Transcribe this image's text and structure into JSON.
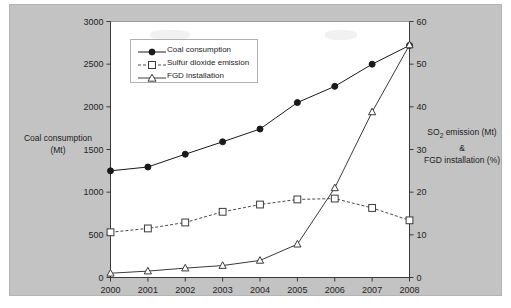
{
  "chart_data": {
    "type": "line",
    "title": "",
    "xlabel": "",
    "ylabel": "Coal consumption (Mt)",
    "y2label": "SO2 emission (Mt) & FGD installation (%)",
    "categories": [
      "2000",
      "2001",
      "2002",
      "2003",
      "2004",
      "2005",
      "2006",
      "2007",
      "2008"
    ],
    "x": [
      2000,
      2001,
      2002,
      2003,
      2004,
      2005,
      2006,
      2007,
      2008
    ],
    "ylim": [
      0,
      3000
    ],
    "y2lim": [
      0,
      60
    ],
    "yticks": [
      0,
      500,
      1000,
      1500,
      2000,
      2500,
      3000
    ],
    "y2ticks": [
      0,
      10,
      20,
      30,
      40,
      50,
      60
    ],
    "grid": false,
    "legend_position": "upper-left-inside",
    "series": [
      {
        "name": "Coal consumption",
        "axis": "left",
        "unit": "Mt",
        "marker": "filled-circle",
        "line": "solid",
        "color": "#1a1a1a",
        "values": [
          1250,
          1295,
          1445,
          1590,
          1740,
          2050,
          2240,
          2500,
          2720
        ]
      },
      {
        "name": "Sulfur dioxide emission",
        "axis": "right",
        "unit": "Mt",
        "marker": "open-square",
        "line": "dotted",
        "color": "#4a4a4a",
        "values": [
          10.6,
          11.5,
          12.9,
          15.4,
          17.1,
          18.3,
          18.5,
          16.3,
          13.4
        ]
      },
      {
        "name": "FGD installation",
        "axis": "right",
        "unit": "%",
        "marker": "open-triangle",
        "line": "solid",
        "color": "#3a3a3a",
        "values": [
          1.0,
          1.5,
          2.2,
          2.8,
          4.0,
          7.8,
          21.0,
          38.8,
          54.5
        ]
      }
    ]
  },
  "axes": {
    "left_title_line1": "Coal consumption",
    "left_title_line2": "(Mt)",
    "right_title_line1_prefix": "SO",
    "right_title_line1_sub": "2",
    "right_title_line1_suffix": " emission (Mt)",
    "right_title_line2": "&",
    "right_title_line3": "FGD installation (%)",
    "left_ticks": [
      "0",
      "500",
      "1000",
      "1500",
      "2000",
      "2500",
      "3000"
    ],
    "right_ticks": [
      "0",
      "10",
      "20",
      "30",
      "40",
      "50",
      "60"
    ],
    "x_ticks": [
      "2000",
      "2001",
      "2002",
      "2003",
      "2004",
      "2005",
      "2006",
      "2007",
      "2008"
    ]
  },
  "legend": {
    "items": [
      {
        "label": "Coal consumption",
        "marker": "filled-circle",
        "line": "solid"
      },
      {
        "label": "Sulfur dioxide emission",
        "marker": "open-square",
        "line": "dotted"
      },
      {
        "label": "FGD installation",
        "marker": "open-triangle",
        "line": "solid"
      }
    ]
  },
  "colors": {
    "figure_background": "#c3c3c3",
    "plot_background": "#ffffff",
    "axis": "#3a3a3a",
    "text": "#1c1c1c"
  }
}
